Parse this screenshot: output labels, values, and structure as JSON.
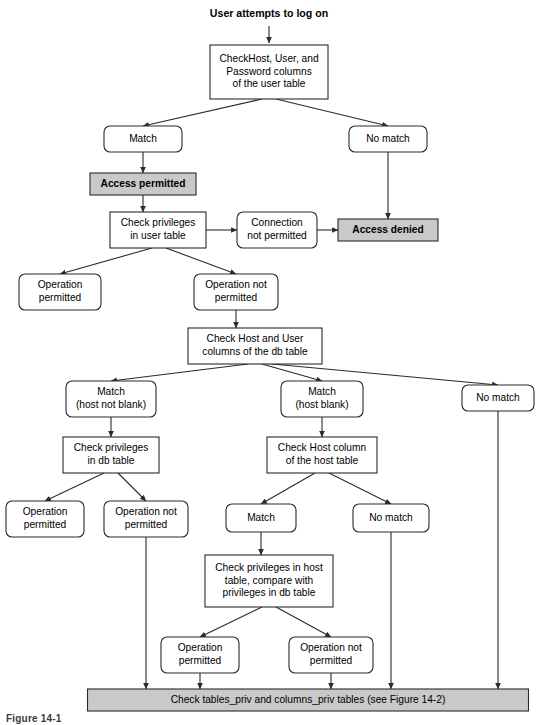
{
  "figure": {
    "caption": "Figure 14-1",
    "title": "User attempts to log on"
  },
  "colors": {
    "shaded_fill": "#c9c9c9",
    "node_fill": "#ffffff",
    "stroke": "#2b2b2b",
    "text": "#000000"
  },
  "nodes": [
    {
      "id": "start",
      "kind": "heading",
      "lines": [
        "User attempts to log on"
      ],
      "x": 269,
      "y": 14,
      "w": 180,
      "h": 16
    },
    {
      "id": "check-user-table",
      "kind": "process",
      "lines": [
        "CheckHost, User, and",
        "Password columns",
        "of the user table"
      ],
      "x": 269,
      "y": 72,
      "w": 118,
      "h": 54
    },
    {
      "id": "match-user",
      "kind": "decision-outcome",
      "lines": [
        "Match"
      ],
      "x": 143,
      "y": 139,
      "w": 78,
      "h": 26
    },
    {
      "id": "no-match-user",
      "kind": "decision-outcome",
      "lines": [
        "No match"
      ],
      "x": 388,
      "y": 139,
      "w": 78,
      "h": 26
    },
    {
      "id": "access-permitted",
      "kind": "shaded",
      "lines": [
        "Access permitted"
      ],
      "x": 143,
      "y": 184,
      "w": 106,
      "h": 22
    },
    {
      "id": "access-denied",
      "kind": "shaded",
      "lines": [
        "Access denied"
      ],
      "x": 388,
      "y": 230,
      "w": 100,
      "h": 22
    },
    {
      "id": "check-priv-user",
      "kind": "process",
      "lines": [
        "Check privileges",
        "in user table"
      ],
      "x": 158,
      "y": 230,
      "w": 96,
      "h": 36
    },
    {
      "id": "connection-not-permitted",
      "kind": "decision-outcome",
      "lines": [
        "Connection",
        "not permitted"
      ],
      "x": 277,
      "y": 230,
      "w": 80,
      "h": 36
    },
    {
      "id": "op-permitted-user",
      "kind": "decision-outcome",
      "lines": [
        "Operation",
        "permitted"
      ],
      "x": 60,
      "y": 292,
      "w": 82,
      "h": 36
    },
    {
      "id": "op-not-permitted-user",
      "kind": "decision-outcome",
      "lines": [
        "Operation not",
        "permitted"
      ],
      "x": 236,
      "y": 292,
      "w": 84,
      "h": 36
    },
    {
      "id": "check-db-table",
      "kind": "process",
      "lines": [
        "Check Host and User",
        "columns of the db table"
      ],
      "x": 255,
      "y": 346,
      "w": 134,
      "h": 36
    },
    {
      "id": "match-host-not-blank",
      "kind": "decision-outcome",
      "lines": [
        "Match",
        "(host not blank)"
      ],
      "x": 111,
      "y": 399,
      "w": 90,
      "h": 36
    },
    {
      "id": "match-host-blank",
      "kind": "decision-outcome",
      "lines": [
        "Match",
        "(host blank)"
      ],
      "x": 322,
      "y": 399,
      "w": 82,
      "h": 36
    },
    {
      "id": "no-match-db",
      "kind": "decision-outcome",
      "lines": [
        "No match"
      ],
      "x": 498,
      "y": 398,
      "w": 72,
      "h": 26
    },
    {
      "id": "check-priv-db",
      "kind": "process",
      "lines": [
        "Check privileges",
        "in db table"
      ],
      "x": 111,
      "y": 455,
      "w": 96,
      "h": 36
    },
    {
      "id": "check-host-column",
      "kind": "process",
      "lines": [
        "Check Host column",
        "of the host table"
      ],
      "x": 322,
      "y": 455,
      "w": 110,
      "h": 36
    },
    {
      "id": "op-permitted-db",
      "kind": "decision-outcome",
      "lines": [
        "Operation",
        "permitted"
      ],
      "x": 45,
      "y": 519,
      "w": 78,
      "h": 36
    },
    {
      "id": "op-not-permitted-db",
      "kind": "decision-outcome",
      "lines": [
        "Operation not",
        "permitted"
      ],
      "x": 146,
      "y": 519,
      "w": 84,
      "h": 36
    },
    {
      "id": "match-host",
      "kind": "decision-outcome",
      "lines": [
        "Match"
      ],
      "x": 261,
      "y": 518,
      "w": 70,
      "h": 28
    },
    {
      "id": "no-match-host",
      "kind": "decision-outcome",
      "lines": [
        "No match"
      ],
      "x": 391,
      "y": 518,
      "w": 76,
      "h": 28
    },
    {
      "id": "check-priv-host",
      "kind": "process",
      "lines": [
        "Check privileges in host",
        "table, compare with",
        "privileges in db table"
      ],
      "x": 269,
      "y": 581,
      "w": 128,
      "h": 52
    },
    {
      "id": "op-permitted-host",
      "kind": "decision-outcome",
      "lines": [
        "Operation",
        "permitted"
      ],
      "x": 200,
      "y": 655,
      "w": 78,
      "h": 36
    },
    {
      "id": "op-not-permitted-host",
      "kind": "decision-outcome",
      "lines": [
        "Operation not",
        "permitted"
      ],
      "x": 331,
      "y": 655,
      "w": 84,
      "h": 36
    },
    {
      "id": "check-tables-priv",
      "kind": "banner",
      "lines": [
        "Check tables_priv and columns_priv tables (see Figure 14-2)"
      ],
      "x": 308,
      "y": 700,
      "w": 441,
      "h": 22
    }
  ],
  "edges": [
    {
      "id": "e-start-check",
      "path": "M 269 26 L 269 43",
      "arrow": true
    },
    {
      "id": "e-check-match",
      "path": "M 262 99 L 143 126",
      "arrow": true
    },
    {
      "id": "e-check-nomatch",
      "path": "M 276 99 L 388 126",
      "arrow": true
    },
    {
      "id": "e-match-permitted",
      "path": "M 143 152 L 143 173",
      "arrow": true
    },
    {
      "id": "e-permitted-checkpriv",
      "path": "M 143 195 L 143 212",
      "arrow": true
    },
    {
      "id": "e-nomatch-denied",
      "path": "M 388 152 L 388 219",
      "arrow": true
    },
    {
      "id": "e-checkpriv-conn",
      "path": "M 206 230 L 237 230",
      "arrow": true
    },
    {
      "id": "e-conn-denied",
      "path": "M 317 230 L 338 230",
      "arrow": true
    },
    {
      "id": "e-checkpriv-opok",
      "path": "M 152 248 L 60 274",
      "arrow": true
    },
    {
      "id": "e-checkpriv-opno",
      "path": "M 166 248 L 236 274",
      "arrow": true
    },
    {
      "id": "e-opno-checkdb",
      "path": "M 236 310 L 236 328",
      "arrow": true
    },
    {
      "id": "e-db-m1",
      "path": "M 248 364 L 111 381",
      "arrow": true
    },
    {
      "id": "e-db-m2",
      "path": "M 262 364 L 322 381",
      "arrow": true
    },
    {
      "id": "e-db-nm",
      "path": "M 272 364 L 498 385",
      "arrow": true
    },
    {
      "id": "e-m1-checkdbpriv",
      "path": "M 111 417 L 111 437",
      "arrow": true
    },
    {
      "id": "e-m2-checkhost",
      "path": "M 322 417 L 322 437",
      "arrow": true
    },
    {
      "id": "e-dbpriv-opok",
      "path": "M 104 473 L 45 501",
      "arrow": true
    },
    {
      "id": "e-dbpriv-opno",
      "path": "M 118 473 L 146 501",
      "arrow": true
    },
    {
      "id": "e-checkhost-match",
      "path": "M 315 473 L 261 504",
      "arrow": true
    },
    {
      "id": "e-checkhost-nomatch",
      "path": "M 329 473 L 391 504",
      "arrow": true
    },
    {
      "id": "e-match-checkpriv-host",
      "path": "M 261 532 L 261 555",
      "arrow": true
    },
    {
      "id": "e-hostpriv-opok",
      "path": "M 262 607 L 200 637",
      "arrow": true
    },
    {
      "id": "e-hostpriv-opno",
      "path": "M 276 607 L 331 637",
      "arrow": true
    },
    {
      "id": "e-opno-db-banner",
      "path": "M 146 537 L 146 689",
      "arrow": true
    },
    {
      "id": "e-nomatch-host-banner",
      "path": "M 391 532 L 391 689",
      "arrow": true
    },
    {
      "id": "e-nomatch-db-banner",
      "path": "M 498 411 L 498 689",
      "arrow": true
    },
    {
      "id": "e-opok-host-banner",
      "path": "M 200 673 L 200 689",
      "arrow": true
    },
    {
      "id": "e-opno-host-banner",
      "path": "M 331 673 L 331 689",
      "arrow": true
    }
  ]
}
